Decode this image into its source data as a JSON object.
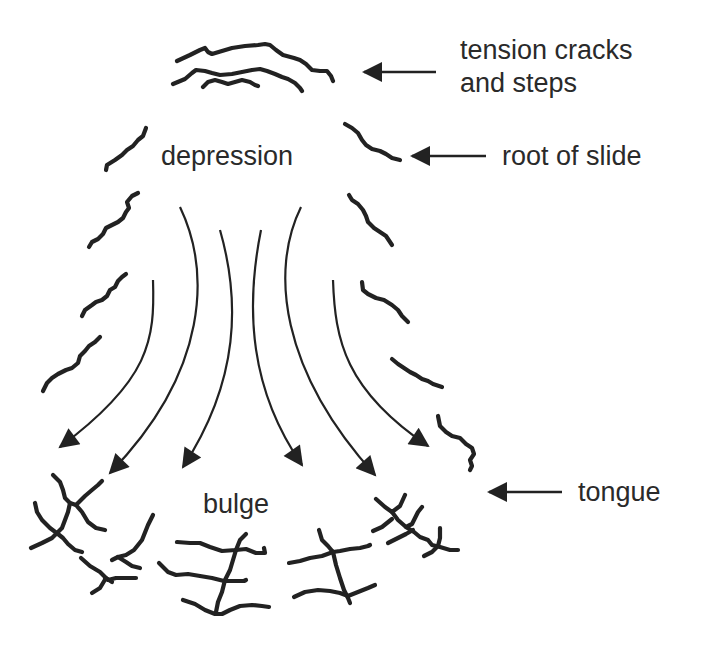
{
  "diagram": {
    "type": "landslide schematic (plan view)",
    "labels": {
      "tension_cracks_line1": "tension cracks",
      "tension_cracks_line2": "and steps",
      "root_of_slide": "root of slide",
      "depression": "depression",
      "bulge": "bulge",
      "tongue": "tongue"
    },
    "pointer_arrows": [
      {
        "target": "tension cracks and steps",
        "direction": "left"
      },
      {
        "target": "root of slide",
        "direction": "left"
      },
      {
        "target": "tongue",
        "direction": "left"
      }
    ],
    "flow_arrows_count": 6,
    "colors": {
      "ink": "#222222",
      "text": "#2a2a2a",
      "background": "#ffffff"
    }
  }
}
